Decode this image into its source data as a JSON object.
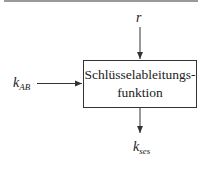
{
  "diagram": {
    "type": "block-diagram",
    "colors": {
      "line": "#333333",
      "text": "#222222",
      "top_rule": "#9a9a9a",
      "background": "#ffffff"
    },
    "block": {
      "line1": "Schlüsselableitungs-",
      "line2": "funktion"
    },
    "inputs": [
      {
        "id": "r",
        "base": "r",
        "sub": "",
        "direction": "from-top"
      },
      {
        "id": "k_AB",
        "base": "k",
        "sub": "AB",
        "direction": "from-left"
      }
    ],
    "outputs": [
      {
        "id": "k_ses",
        "base": "k",
        "sub": "ses",
        "direction": "to-bottom"
      }
    ],
    "edges": [
      {
        "from": "r",
        "to": "block"
      },
      {
        "from": "k_AB",
        "to": "block"
      },
      {
        "from": "block",
        "to": "k_ses"
      }
    ]
  }
}
